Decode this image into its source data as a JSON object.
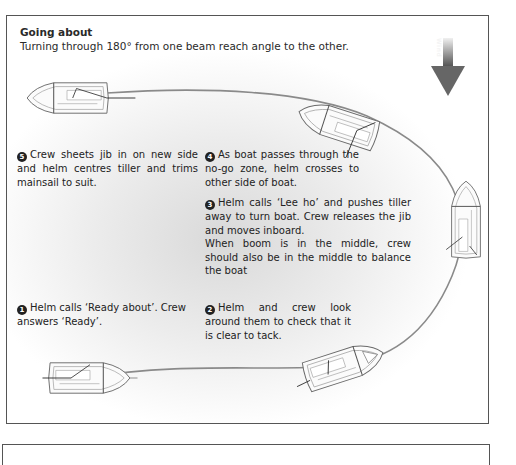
{
  "header": {
    "title": "Going about",
    "subtitle": "Turning through 180° from one beam reach angle to the other."
  },
  "wind": {
    "label": "Wind",
    "icon": "down-arrow-icon"
  },
  "steps": [
    {
      "number": "1",
      "text": "Helm calls ‘Ready about’. Crew answers ‘Ready’."
    },
    {
      "number": "2",
      "text": "Helm and crew look around them to check that it is clear to tack."
    },
    {
      "number": "3",
      "text": "Helm calls ‘Lee ho’ and pushes tiller away to turn boat. Crew releases the jib and moves inboard.",
      "text2": "When boom is in the middle, crew should also be in the middle to balance the boat"
    },
    {
      "number": "4",
      "text": "As boat passes through the no-go zone, helm crosses to other side of boat."
    },
    {
      "number": "5",
      "text": "Crew sheets jib in on new side and helm centres tiller and trims mainsail to suit."
    }
  ],
  "colors": {
    "border": "#555555",
    "path": "#8a8a8a",
    "hull": "#6a6a6a",
    "text": "#222222"
  }
}
